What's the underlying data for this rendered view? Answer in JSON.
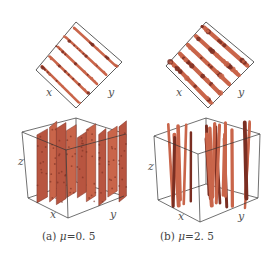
{
  "figure": {
    "colors": {
      "particle": "#c9654a",
      "particle_dark": "#7a2e22",
      "box_outline": "#333333",
      "text": "#444444"
    },
    "panels": [
      {
        "id": "a",
        "caption_prefix": "(a) ",
        "caption_symbol": "μ",
        "caption_value": "=0. 5",
        "top_view_axes": {
          "x": "x",
          "y": "y"
        },
        "perspective_axes": {
          "x": "x",
          "y": "y",
          "z": "z"
        },
        "top_view_stripes": 5,
        "structure": "lamellar sheets"
      },
      {
        "id": "b",
        "caption_prefix": "(b) ",
        "caption_symbol": "μ",
        "caption_value": "=2. 5",
        "top_view_axes": {
          "x": "x",
          "y": "y"
        },
        "perspective_axes": {
          "x": "x",
          "y": "y",
          "z": "z"
        },
        "top_view_stripes": 5,
        "structure": "columnar chains"
      }
    ]
  }
}
